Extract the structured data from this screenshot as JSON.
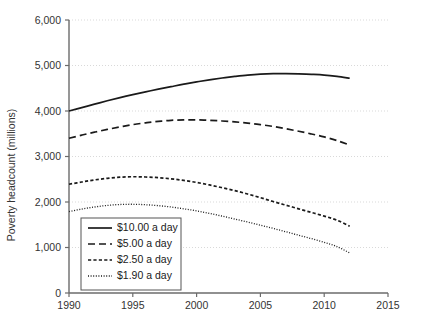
{
  "chart_data": {
    "type": "line",
    "title": "",
    "xlabel": "",
    "ylabel": "Poverty headcount (millions)",
    "xlim": [
      1990,
      2015
    ],
    "ylim": [
      0,
      6000
    ],
    "xticks": [
      "1990",
      "1995",
      "2000",
      "2005",
      "2010",
      "2015"
    ],
    "xtick_values": [
      1990,
      1995,
      2000,
      2005,
      2010,
      2015
    ],
    "yticks": [
      "0",
      "1,000",
      "2,000",
      "3,000",
      "4,000",
      "5,000",
      "6,000"
    ],
    "ytick_values": [
      0,
      1000,
      2000,
      3000,
      4000,
      5000,
      6000
    ],
    "grid": "horizontal-dotted",
    "legend_position": "lower-left-inside",
    "x": [
      1990,
      1991,
      1992,
      1993,
      1994,
      1995,
      1996,
      1997,
      1998,
      1999,
      2000,
      2001,
      2002,
      2003,
      2004,
      2005,
      2006,
      2007,
      2008,
      2009,
      2010,
      2011,
      2012
    ],
    "series": [
      {
        "name": "$10.00 a day",
        "dash": "solid",
        "values": [
          4000,
          4075,
          4150,
          4225,
          4295,
          4360,
          4420,
          4480,
          4535,
          4590,
          4640,
          4685,
          4725,
          4760,
          4790,
          4810,
          4820,
          4820,
          4815,
          4805,
          4790,
          4760,
          4720
        ]
      },
      {
        "name": "$5.00 a day",
        "dash": "long-dash",
        "values": [
          3400,
          3470,
          3535,
          3595,
          3650,
          3700,
          3740,
          3772,
          3795,
          3805,
          3805,
          3795,
          3780,
          3760,
          3735,
          3700,
          3660,
          3610,
          3555,
          3495,
          3430,
          3350,
          3250
        ]
      },
      {
        "name": "$2.50 a day",
        "dash": "short-dash",
        "values": [
          2390,
          2440,
          2485,
          2520,
          2545,
          2555,
          2550,
          2535,
          2510,
          2475,
          2430,
          2375,
          2315,
          2250,
          2175,
          2095,
          2010,
          1930,
          1850,
          1770,
          1690,
          1600,
          1470
        ]
      },
      {
        "name": "$1.90 a day",
        "dash": "dotted",
        "values": [
          1790,
          1845,
          1890,
          1925,
          1945,
          1950,
          1940,
          1920,
          1890,
          1850,
          1805,
          1750,
          1690,
          1625,
          1560,
          1490,
          1420,
          1345,
          1270,
          1195,
          1115,
          1020,
          880
        ]
      }
    ]
  },
  "legend": {
    "items": [
      {
        "label": "$10.00 a day",
        "dash": "solid"
      },
      {
        "label": "$5.00 a day",
        "dash": "long-dash"
      },
      {
        "label": "$2.50 a day",
        "dash": "short-dash"
      },
      {
        "label": "$1.90 a day",
        "dash": "dotted"
      }
    ]
  },
  "colors": {
    "line": "#1a1a1a",
    "axis": "#6b6b6b",
    "grid": "#cfcfcf",
    "text": "#333333",
    "background": "#ffffff"
  }
}
